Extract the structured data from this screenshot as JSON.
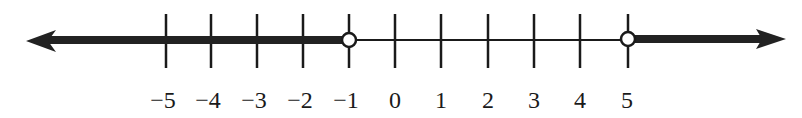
{
  "number_line": {
    "ticks": [
      -5,
      -4,
      -3,
      -2,
      -1,
      0,
      1,
      2,
      3,
      4,
      5
    ],
    "labels": [
      "−5",
      "−4",
      "−3",
      "−2",
      "−1",
      "0",
      "1",
      "2",
      "3",
      "4",
      "5"
    ],
    "open_points": [
      -1,
      5
    ],
    "shaded_rays": [
      {
        "direction": "left",
        "from": -1
      },
      {
        "direction": "right",
        "from": 5
      }
    ],
    "line_color": "#1a1a1a",
    "shade_color": "#222222"
  }
}
